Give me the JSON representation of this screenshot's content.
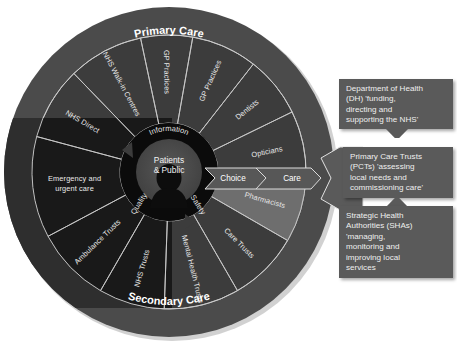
{
  "diagram": {
    "title_top": "Primary Care",
    "title_bottom": "Secondary Care",
    "core": {
      "center_line1": "Patients",
      "center_line2": "& Public",
      "ring_labels": [
        "Information",
        "Safety",
        "Quality"
      ],
      "silhouette": "person-head-silhouette"
    },
    "flow": {
      "step1": "Choice",
      "step2": "Care"
    },
    "segments": [
      {
        "label": "GP Practices",
        "group": "primary",
        "highlight": false,
        "start": -80,
        "end": -52
      },
      {
        "label": "Dentists",
        "group": "primary",
        "highlight": false,
        "start": -52,
        "end": -26
      },
      {
        "label": "Opticians",
        "group": "primary",
        "highlight": false,
        "start": -26,
        "end": 2
      },
      {
        "label": "Pharmacists",
        "group": "primary",
        "highlight": true,
        "start": 2,
        "end": 30
      },
      {
        "label": "Care Trusts",
        "group": "secondary",
        "highlight": false,
        "start": 30,
        "end": 60
      },
      {
        "label": "Mental Health Trusts",
        "group": "secondary",
        "highlight": false,
        "start": 60,
        "end": 92
      },
      {
        "label": "NHS Trusts",
        "group": "secondary",
        "highlight": false,
        "start": 92,
        "end": 120
      },
      {
        "label": "Ambulance Trusts",
        "group": "secondary",
        "highlight": false,
        "start": 120,
        "end": 152
      },
      {
        "label": "Emergency and urgent care",
        "group": "secondary",
        "highlight": false,
        "start": 152,
        "end": 195
      },
      {
        "label": "NHS Direct",
        "group": "primary",
        "highlight": false,
        "start": 195,
        "end": 226
      },
      {
        "label": "NHS Walk-in Centres",
        "group": "primary",
        "highlight": false,
        "start": 226,
        "end": 258
      },
      {
        "label": "GP Practices ",
        "group": "primary",
        "highlight": false,
        "start": 258,
        "end": 280
      }
    ],
    "callouts": [
      {
        "name": "department-of-health",
        "lines": [
          "Department of Health",
          "(DH) 'funding,",
          "directing and",
          "supporting the NHS'"
        ]
      },
      {
        "name": "primary-care-trusts",
        "lines": [
          "Primary Care Trusts",
          "(PCTs) 'assessing",
          "local needs and",
          "commissioning care'"
        ]
      },
      {
        "name": "strategic-health-authorities",
        "lines": [
          "Strategic Health",
          "Authorities (SHAs)",
          "'managing,",
          "monitoring and",
          "improving local",
          "services"
        ]
      }
    ],
    "colors": {
      "outer_ring": "#4b4b4b",
      "segment_dark": "#3c3c3c",
      "segment_darker": "#1d1d1d",
      "segment_highlight": "#6e6e6e",
      "core_ring": "#0b0b0b",
      "core_inner": "#4d4d4d",
      "callout_bg": "#5a5a5a",
      "text": "#ededed",
      "divider": "#c9c9c9"
    }
  }
}
